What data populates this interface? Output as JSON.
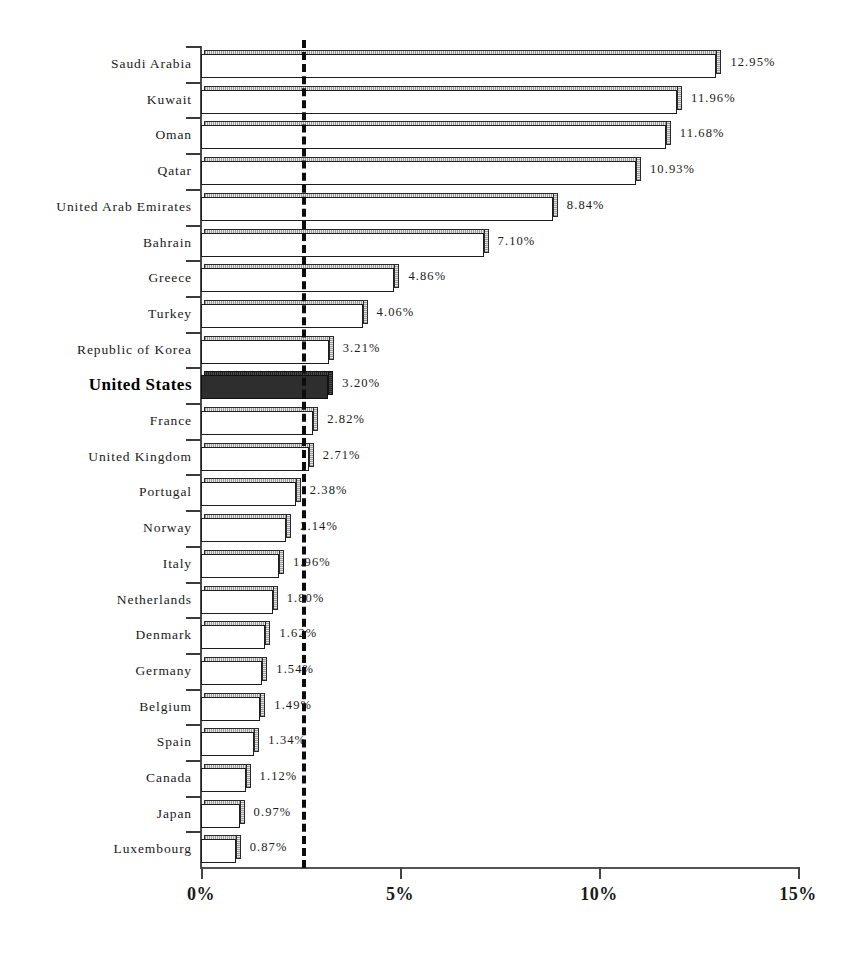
{
  "chart_data": {
    "type": "bar",
    "orientation": "horizontal",
    "title": "",
    "subtitle": "",
    "xlabel": "",
    "ylabel": "",
    "xlim": [
      0,
      15
    ],
    "xtick_labels": [
      "0%",
      "5%",
      "10%",
      "15%"
    ],
    "xtick_values": [
      0,
      5,
      10,
      15
    ],
    "grid": false,
    "legend": null,
    "value_suffix": "%",
    "highlight_category": "United States",
    "reference_line": {
      "value": 2.54,
      "style": "dashed",
      "color": "#0d0d0d",
      "label": ""
    },
    "categories": [
      "Saudi Arabia",
      "Kuwait",
      "Oman",
      "Qatar",
      "United Arab Emirates",
      "Bahrain",
      "Greece",
      "Turkey",
      "Republic of Korea",
      "United States",
      "France",
      "United Kingdom",
      "Portugal",
      "Norway",
      "Italy",
      "Netherlands",
      "Denmark",
      "Germany",
      "Belgium",
      "Spain",
      "Canada",
      "Japan",
      "Luxembourg"
    ],
    "values": [
      12.95,
      11.96,
      11.68,
      10.93,
      8.84,
      7.1,
      4.86,
      4.06,
      3.21,
      3.2,
      2.82,
      2.71,
      2.38,
      2.14,
      1.96,
      1.8,
      1.62,
      1.54,
      1.49,
      1.34,
      1.12,
      0.97,
      0.87
    ],
    "value_labels": [
      "12.95%",
      "11.96%",
      "11.68%",
      "10.93%",
      "8.84%",
      "7.10%",
      "4.86%",
      "4.06%",
      "3.21%",
      "3.20%",
      "2.82%",
      "2.71%",
      "2.38%",
      "2.14%",
      "1.96%",
      "1.80%",
      "1.62%",
      "1.54%",
      "1.49%",
      "1.34%",
      "1.12%",
      "0.97%",
      "0.87%"
    ],
    "colors": {
      "bar_fill": "#ffffff",
      "bar_edge": "#1d1d1d",
      "highlight_fill": "#2e2e2e",
      "axis": "#4a4a4a",
      "text": "#1a1a1a",
      "reference_line": "#0d0d0d",
      "background": "#ffffff"
    }
  },
  "axis": {
    "ticks": [
      {
        "label": "0%",
        "value": 0
      },
      {
        "label": "5%",
        "value": 5
      },
      {
        "label": "10%",
        "value": 10
      },
      {
        "label": "15%",
        "value": 15
      }
    ]
  }
}
